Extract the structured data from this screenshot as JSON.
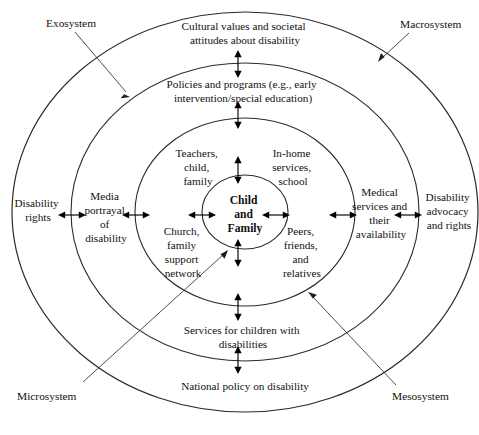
{
  "figure": {
    "colors": {
      "macrosystem_band": "#a8a8a8",
      "exosystem_band": "#d2d2d2",
      "mesosystem_band": "#d2d2d2",
      "microsystem_band": "#d2d2d2",
      "center": "#d2d2d2",
      "outline": "#2b2b2b",
      "text": "#111111",
      "leader_line": "#3a3a3a"
    }
  },
  "center": {
    "name": "child-and-family",
    "lines": [
      "Child",
      "and",
      "Family"
    ]
  },
  "rings": [
    {
      "id": "microsystem-ring",
      "labels": [
        {
          "name": "teachers-child-family",
          "lines": [
            "Teachers,",
            "child,",
            "family"
          ]
        },
        {
          "name": "in-home-services-school",
          "lines": [
            "In-home",
            "services,",
            "school"
          ]
        },
        {
          "name": "church-family-support-network",
          "lines": [
            "Church,",
            "family",
            "support",
            "network"
          ]
        },
        {
          "name": "peers-friends-relatives",
          "lines": [
            "Peers,",
            "friends,",
            "and",
            "relatives"
          ]
        }
      ]
    },
    {
      "id": "mesosystem-ring",
      "labels": [
        {
          "name": "policies-and-programs",
          "lines": [
            "Policies and programs (e.g., early",
            "intervention/special education)"
          ]
        },
        {
          "name": "services-for-children",
          "lines": [
            "Services for children with",
            "disabilities"
          ]
        },
        {
          "name": "media-portrayal",
          "lines": [
            "Media",
            "portrayal",
            "of",
            "disability"
          ]
        },
        {
          "name": "medical-services",
          "lines": [
            "Medical",
            "services and",
            "their",
            "availability"
          ]
        }
      ]
    },
    {
      "id": "macrosystem-ring",
      "labels": [
        {
          "name": "cultural-values",
          "lines": [
            "Cultural values and societal",
            "attitudes about disability"
          ]
        },
        {
          "name": "national-policy",
          "lines": [
            "National policy on disability"
          ]
        },
        {
          "name": "disability-rights",
          "lines": [
            "Disability",
            "rights"
          ]
        },
        {
          "name": "disability-advocacy",
          "lines": [
            "Disability",
            "advocacy",
            "and rights"
          ]
        }
      ]
    }
  ],
  "system_callouts": [
    {
      "name": "exosystem-label",
      "text": "Exosystem"
    },
    {
      "name": "macrosystem-label",
      "text": "Macrosystem"
    },
    {
      "name": "microsystem-label",
      "text": "Microsystem"
    },
    {
      "name": "mesosystem-label",
      "text": "Mesosystem"
    }
  ]
}
